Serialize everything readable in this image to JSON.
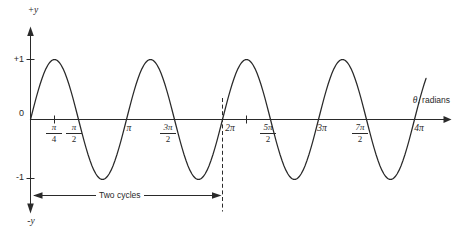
{
  "labels": {
    "y_axis_positive": "+y",
    "y_axis_negative": "-y",
    "y_tick_plus_one": "+1",
    "y_tick_zero": "0",
    "y_tick_minus_one": "-1",
    "x_axis_symbol": "θ",
    "x_axis_rest": ", radians",
    "two_cycles": "Two cycles",
    "x_ticks": [
      {
        "num": "π",
        "den": "4"
      },
      {
        "num": "π",
        "den": "2"
      },
      {
        "text": "π"
      },
      {
        "num": "3π",
        "den": "2"
      },
      {
        "text": "2π"
      },
      {
        "num": "5π",
        "den": "2"
      },
      {
        "text": "3π"
      },
      {
        "num": "7π",
        "den": "2"
      },
      {
        "text": "4π"
      }
    ]
  },
  "chart_data": {
    "type": "line",
    "function": "y = sin(2θ)",
    "amplitude": 1,
    "angular_frequency": 2,
    "xlabel": "θ, radians",
    "ylabel": "y",
    "x_range_pi_units": [
      0,
      4.12
    ],
    "ylim": [
      -1,
      1
    ],
    "x_ticks": [
      "π/4",
      "π/2",
      "π",
      "3π/2",
      "2π",
      "5π/2",
      "3π",
      "7π/2",
      "4π"
    ],
    "y_ticks": [
      "+1",
      "0",
      "-1"
    ],
    "x_samples_pi_units": [
      0,
      0.25,
      0.5,
      0.75,
      1,
      1.25,
      1.5,
      1.75,
      2,
      2.25,
      2.5,
      2.75,
      3,
      3.25,
      3.5,
      3.75,
      4
    ],
    "y_samples": [
      0,
      1,
      0,
      -1,
      0,
      1,
      0,
      -1,
      0,
      1,
      0,
      -1,
      0,
      1,
      0,
      -1,
      0
    ],
    "grid": false,
    "legend": null,
    "annotations": [
      {
        "type": "span-arrow",
        "label": "Two cycles",
        "from_pi_units": 0,
        "to_pi_units": 2
      },
      {
        "type": "dashed-vline",
        "at": "2π",
        "at_pi_units": 2
      }
    ]
  }
}
